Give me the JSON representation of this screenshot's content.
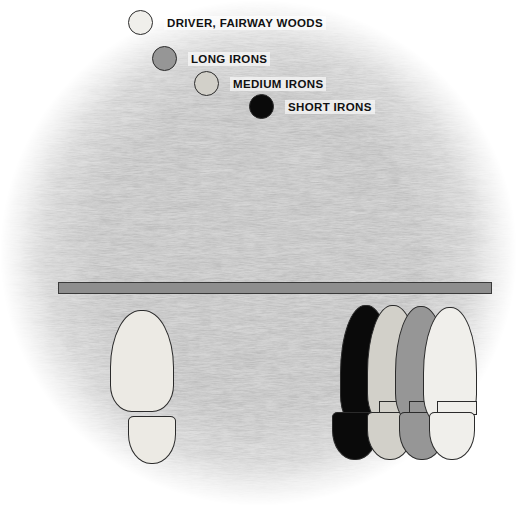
{
  "figure": {
    "width": 517,
    "height": 506,
    "background_color": "#ffffff"
  },
  "colors": {
    "driver_fairway_woods": "#f0efeb",
    "long_irons": "#969696",
    "medium_irons": "#d2d0c9",
    "short_irons": "#0a0a0a",
    "outline": "#2b2b2b",
    "alignment_rod_fill": "#8e8e8e",
    "grass_light": "#e9e9e9",
    "grass_mid": "#b9b9b9",
    "grass_dark": "#7d7d7d"
  },
  "legend": {
    "name": "club-legend",
    "items": [
      {
        "id": "driver-fairway-woods",
        "label": "DRIVER, FAIRWAY WOODS",
        "swatch_color": "#f0efeb",
        "swatch_icon": "filled-circle-icon",
        "x": 128,
        "y": 10
      },
      {
        "id": "long-irons",
        "label": "LONG IRONS",
        "swatch_color": "#969696",
        "swatch_icon": "filled-circle-icon",
        "x": 152,
        "y": 46
      },
      {
        "id": "medium-irons",
        "label": "MEDIUM IRONS",
        "swatch_color": "#d2d0c9",
        "swatch_icon": "filled-circle-icon",
        "x": 194,
        "y": 71
      },
      {
        "id": "short-irons",
        "label": "SHORT IRONS",
        "swatch_color": "#0a0a0a",
        "swatch_icon": "filled-circle-icon",
        "x": 249,
        "y": 94
      }
    ]
  },
  "alignment_rod": {
    "name": "alignment-rod",
    "fill": "#8e8e8e",
    "x": 58,
    "y": 282,
    "width": 434,
    "height": 12
  },
  "footprints": {
    "front_foot": {
      "id": "front-foot-print",
      "label": "FRONT FOOT",
      "color": "#eceae4",
      "sole": {
        "x": 110,
        "y": 310,
        "width": 64,
        "height": 102
      },
      "heel": {
        "x": 128,
        "y": 416,
        "width": 48,
        "height": 48
      }
    },
    "back_feet": [
      {
        "id": "back-foot-short-irons",
        "club": "SHORT IRONS",
        "color": "#0a0a0a",
        "sole": {
          "x": 340,
          "y": 305,
          "width": 52,
          "height": 122
        },
        "heel": {
          "x": 332,
          "y": 412,
          "width": 46,
          "height": 48
        },
        "tab": {
          "x": 348,
          "y": 402,
          "width": 40,
          "height": 14
        }
      },
      {
        "id": "back-foot-medium-irons",
        "club": "MEDIUM IRONS",
        "color": "#d2d0c9",
        "sole": {
          "x": 367,
          "y": 305,
          "width": 52,
          "height": 120
        },
        "heel": {
          "x": 367,
          "y": 412,
          "width": 46,
          "height": 48
        },
        "tab": {
          "x": 379,
          "y": 402,
          "width": 40,
          "height": 14
        }
      },
      {
        "id": "back-foot-long-irons",
        "club": "LONG IRONS",
        "color": "#969696",
        "sole": {
          "x": 395,
          "y": 306,
          "width": 52,
          "height": 118
        },
        "heel": {
          "x": 399,
          "y": 412,
          "width": 46,
          "height": 48
        },
        "tab": {
          "x": 409,
          "y": 402,
          "width": 40,
          "height": 14
        }
      },
      {
        "id": "back-foot-driver-fairway-woods",
        "club": "DRIVER, FAIRWAY WOODS",
        "color": "#f0efeb",
        "sole": {
          "x": 423,
          "y": 307,
          "width": 54,
          "height": 118
        },
        "heel": {
          "x": 429,
          "y": 412,
          "width": 46,
          "height": 48
        },
        "tab": {
          "x": 437,
          "y": 402,
          "width": 40,
          "height": 14
        }
      }
    ]
  }
}
